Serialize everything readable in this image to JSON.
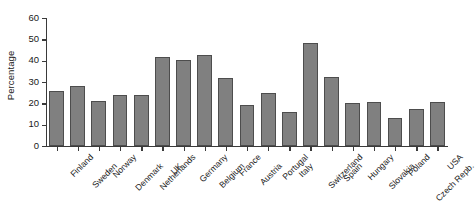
{
  "chart_data": {
    "type": "bar",
    "title": "",
    "xlabel": "",
    "ylabel": "Percentage",
    "ylim": [
      0,
      60
    ],
    "yticks": [
      0,
      10,
      20,
      30,
      40,
      50,
      60
    ],
    "grid": false,
    "legend": null,
    "bar_color": "#808080",
    "bar_edge_color": "#4d4d4d",
    "categories": [
      "Finland",
      "Sweden",
      "Norway",
      "Denmark",
      "Netherlands",
      "UK",
      "Germany",
      "Belgium",
      "France",
      "Austria",
      "Portugal",
      "Italy",
      "Switzerland",
      "Spain",
      "Hungary",
      "Slovakia",
      "Poland",
      "Czech Repb.",
      "USA"
    ],
    "values": [
      26,
      28,
      21,
      24,
      24,
      41.5,
      40.5,
      42.5,
      32,
      19,
      25,
      16,
      48.5,
      32.5,
      20,
      20.5,
      13,
      17.5,
      20.5
    ],
    "series": [
      {
        "name": "Percentage",
        "values": [
          26,
          28,
          21,
          24,
          24,
          41.5,
          40.5,
          42.5,
          32,
          19,
          25,
          16,
          48.5,
          32.5,
          20,
          20.5,
          13,
          17.5,
          20.5
        ]
      }
    ]
  }
}
